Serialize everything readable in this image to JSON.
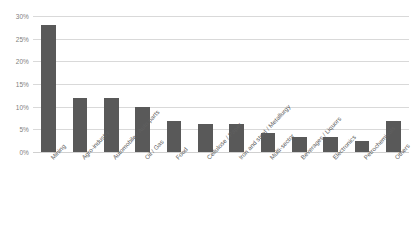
{
  "chart_data": {
    "type": "bar",
    "title": "",
    "subtitle": "",
    "xlabel": "",
    "ylabel": "",
    "ylim": [
      0,
      30
    ],
    "ytick_labels": [
      "0%",
      "5%",
      "10%",
      "15%",
      "20%",
      "25%",
      "30%"
    ],
    "ytick_values": [
      0,
      5,
      10,
      15,
      20,
      25,
      30
    ],
    "grid": true,
    "legend": false,
    "legend_position": "none",
    "value_suffix": "%",
    "bar_color": "#595959",
    "gridline_color": "#d9d9d9",
    "axis_text_color": "#808080",
    "background_color": "#ffffff",
    "categories": [
      "Mining",
      "Agro-industry",
      "Automobile / Auto parts",
      "Oil / Gas",
      "Food",
      "Cellulose / Paper",
      "Iron and steel / Metallurgy",
      "Multi-sector",
      "Beverages / Liquors",
      "Electronics",
      "Petrochemicals",
      "Others"
    ],
    "values": [
      28,
      12,
      12,
      10,
      6.8,
      6.2,
      6.2,
      4.3,
      3.4,
      3.3,
      2.4,
      6.8
    ]
  }
}
